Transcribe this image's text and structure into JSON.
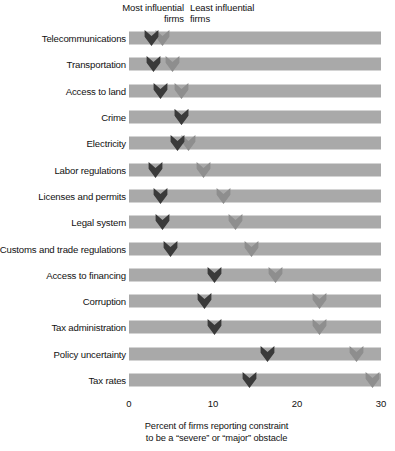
{
  "legend": {
    "most_label": "Most influential\nfirms",
    "least_label": "Least influential\nfirms",
    "most_color": "#3a3a3a",
    "least_color": "#8e8e8e"
  },
  "axis": {
    "caption": "Percent of firms reporting constraint\nto be a “severe” or “major” obstacle",
    "ticks": [
      "0",
      "10",
      "20",
      "30"
    ],
    "tick_values": [
      0,
      10,
      20,
      30
    ],
    "min": 0,
    "max": 30
  },
  "track_color": "#a9a9a9",
  "chart_data": {
    "type": "scatter",
    "title": "",
    "subtitle": "",
    "xlabel": "Percent of firms reporting constraint to be a “severe” or “major” obstacle",
    "ylabel": "",
    "xlim": [
      0,
      30
    ],
    "grid": false,
    "legend_position": "top",
    "categories": [
      "Telecommunications",
      "Transportation",
      "Access to land",
      "Crime",
      "Electricity",
      "Labor regulations",
      "Licenses and permits",
      "Legal system",
      "Customs and trade regulations",
      "Access to financing",
      "Corruption",
      "Tax administration",
      "Policy uncertainty",
      "Tax rates"
    ],
    "series": [
      {
        "name": "Most influential firms",
        "color": "#3a3a3a",
        "values": [
          2.7,
          2.9,
          3.8,
          6.2,
          5.8,
          3.1,
          3.8,
          4.0,
          4.9,
          10.2,
          9.0,
          10.2,
          16.5,
          14.4
        ]
      },
      {
        "name": "Least influential firms",
        "color": "#8e8e8e",
        "values": [
          4.0,
          5.2,
          6.2,
          6.2,
          7.1,
          8.9,
          11.3,
          12.7,
          14.6,
          17.4,
          22.7,
          22.7,
          27.1,
          29.0
        ]
      }
    ]
  }
}
